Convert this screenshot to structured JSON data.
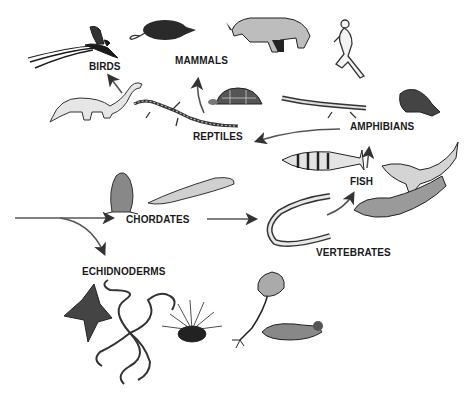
{
  "colors": {
    "ink": "#1a1a1a",
    "arrow": "#555555",
    "background": "#ffffff"
  },
  "labels": {
    "birds": "BIRDS",
    "mammals": "MAMMALS",
    "reptiles": "REPTILES",
    "amphibians": "AMPHIBIANS",
    "fish": "FISH",
    "chordates": "CHORDATES",
    "vertebrates": "VERTEBRATES",
    "echinoderms": "ECHIDNODERMS"
  },
  "groups": [
    {
      "label": "BIRDS",
      "illustrations": [
        "long-tailed-bird"
      ]
    },
    {
      "label": "MAMMALS",
      "illustrations": [
        "rat",
        "rhinoceros",
        "running-human"
      ]
    },
    {
      "label": "REPTILES",
      "illustrations": [
        "sauropod-dinosaur",
        "lizard",
        "tortoise"
      ]
    },
    {
      "label": "AMPHIBIANS",
      "illustrations": [
        "salamander",
        "frog"
      ]
    },
    {
      "label": "FISH",
      "illustrations": [
        "striped-perch",
        "shark",
        "flatfish"
      ]
    },
    {
      "label": "VERTEBRATES",
      "illustrations": [
        "lamprey"
      ]
    },
    {
      "label": "CHORDATES",
      "illustrations": [
        "sea-squirt",
        "lancelet"
      ]
    },
    {
      "label": "ECHIDNODERMS",
      "illustrations": [
        "starfish",
        "brittle-star",
        "sea-urchin",
        "sea-lily",
        "sea-cucumber"
      ]
    }
  ],
  "arrows": [
    {
      "from": "origin",
      "to": "CHORDATES"
    },
    {
      "from": "origin",
      "to": "ECHIDNODERMS"
    },
    {
      "from": "CHORDATES",
      "to": "VERTEBRATES"
    },
    {
      "from": "VERTEBRATES",
      "to": "FISH"
    },
    {
      "from": "FISH",
      "to": "AMPHIBIANS"
    },
    {
      "from": "AMPHIBIANS",
      "to": "REPTILES"
    },
    {
      "from": "REPTILES",
      "to": "BIRDS"
    },
    {
      "from": "REPTILES",
      "to": "MAMMALS"
    }
  ]
}
